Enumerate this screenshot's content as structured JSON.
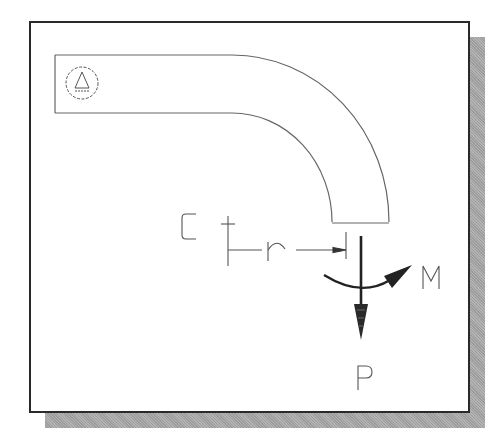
{
  "diagram": {
    "type": "curved-beam free body diagram",
    "labels": {
      "center": "C",
      "radius": "r",
      "moment": "M",
      "force": "P"
    },
    "elements": [
      {
        "name": "curved-beam",
        "description": "Beam with straight horizontal segment fixed at left, curving 90° downward to a free end"
      },
      {
        "name": "fixed-support-symbol",
        "description": "Circle containing a triangle with hatched base, indicating support at left end"
      },
      {
        "name": "center-mark",
        "label_ref": "center",
        "description": "Cross mark marking the center of curvature C"
      },
      {
        "name": "radius-dimension",
        "label_ref": "radius",
        "description": "Horizontal dimension line from C to the line of action of P"
      },
      {
        "name": "moment-arrow",
        "label_ref": "moment",
        "description": "Curved arrow around the free end, clockwise-to-right"
      },
      {
        "name": "force-arrow",
        "label_ref": "force",
        "description": "Vertical downward force arrow at beam free end"
      }
    ],
    "colors": {
      "frame_border": "#2a2a2a",
      "shadow": "#a8a8a8",
      "line": "#555555",
      "arrow": "#222222",
      "background": "#ffffff"
    }
  }
}
